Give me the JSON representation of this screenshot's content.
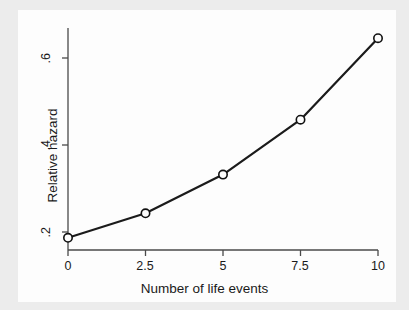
{
  "chart_data": {
    "type": "line",
    "title": "",
    "xlabel": "Number of life events",
    "ylabel": "Relative hazard",
    "x": [
      0,
      2.5,
      5,
      7.5,
      10
    ],
    "values": [
      0.16,
      0.22,
      0.315,
      0.45,
      0.65
    ],
    "series": [
      {
        "name": "Relative hazard",
        "values": [
          0.16,
          0.22,
          0.315,
          0.45,
          0.65
        ]
      }
    ],
    "xticks": [
      "0",
      "2.5",
      "5",
      "7.5",
      "10"
    ],
    "xtick_values": [
      0,
      2.5,
      5,
      7.5,
      10
    ],
    "yticks": [
      ".2",
      ".4",
      ".6"
    ],
    "ytick_values": [
      0.2,
      0.4,
      0.6
    ],
    "xlim": [
      0,
      10
    ],
    "ylim": [
      0.13,
      0.675
    ],
    "grid": false,
    "legend": "none",
    "marker": "circle-open",
    "line_color": "#1b1b1b",
    "marker_fill": "#fdfdfd",
    "marker_stroke": "#111111",
    "axis_color": "#4a4a4a",
    "plot_background": "#fdfdfd",
    "figure_background": "#ececec"
  },
  "axes": {
    "x_tick_labels": [
      "0",
      "2.5",
      "5",
      "7.5",
      "10"
    ],
    "y_tick_labels": [
      ".2",
      ".4",
      ".6"
    ],
    "x_axis_title": "Number of life events",
    "y_axis_title": "Relative hazard"
  }
}
